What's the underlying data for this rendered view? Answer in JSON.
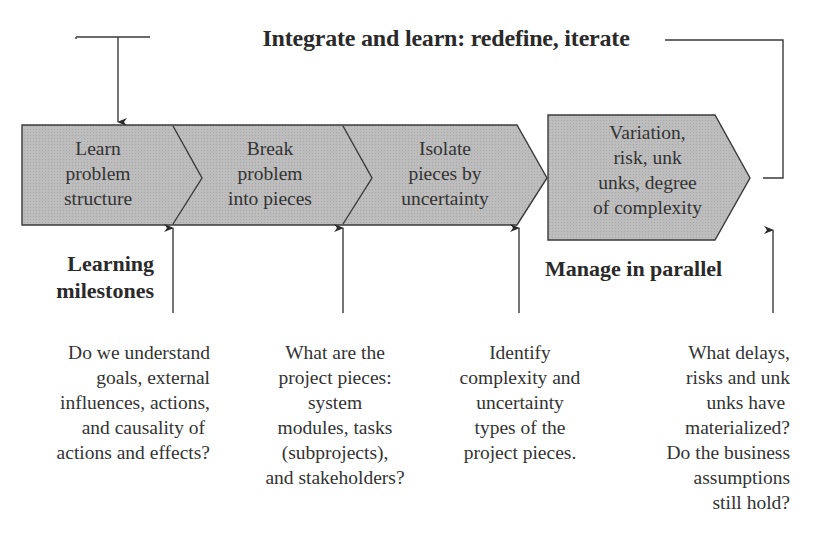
{
  "diagram": {
    "loop_label": "Integrate and learn: redefine, iterate",
    "steps": [
      {
        "label": "Learn\nproblem\nstructure"
      },
      {
        "label": "Break\nproblem\ninto pieces"
      },
      {
        "label": "Isolate\npieces by\nuncertainty"
      },
      {
        "label": "Variation,\nrisk, unk\nunks, degree\nof complexity"
      }
    ],
    "left_heading": "Learning\nmilestones",
    "right_heading": "Manage in parallel",
    "milestone_questions": [
      "Do we understand\ngoals, external\ninfluences, actions,\nand causality of \nactions and effects?",
      "What are the\nproject pieces:\nsystem\nmodules, tasks\n(subprojects),\nand stakeholders?",
      "Identify\ncomplexity and\nuncertainty\ntypes of the\nproject pieces.",
      "What delays,\nrisks and unk\nunks have \nmaterialized?\nDo the business\nassumptions\nstill hold?"
    ],
    "colors": {
      "shape_fill": "#b9b9b9",
      "stroke": "#3a3a3a",
      "text": "#2a2a2a"
    }
  }
}
